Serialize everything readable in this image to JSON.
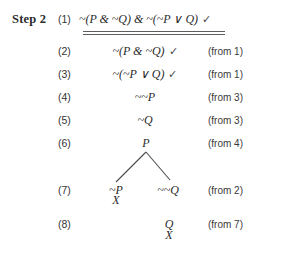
{
  "step": {
    "label": "Step 2"
  },
  "symbols": {
    "negation": "~",
    "conjunction": "&",
    "disjunction": "∨",
    "check": "✓",
    "closure": "X"
  },
  "lines": [
    {
      "number": "(1)",
      "formula": "~(P & ~Q) & ~(~P ∨ Q)",
      "check": "✓",
      "justification": ""
    },
    {
      "number": "(2)",
      "formula": "~(P & ~Q)",
      "check": "✓",
      "justification": "(from 1)"
    },
    {
      "number": "(3)",
      "formula": "~(~P ∨ Q)",
      "check": "✓",
      "justification": "(from 1)"
    },
    {
      "number": "(4)",
      "formula": "~~P",
      "check": "",
      "justification": "(from 3)"
    },
    {
      "number": "(5)",
      "formula": "~Q",
      "check": "",
      "justification": "(from 3)"
    },
    {
      "number": "(6)",
      "formula": "P",
      "check": "",
      "justification": "(from 4)"
    },
    {
      "number": "(7)",
      "formula_left": "~P",
      "formula_right": "~~Q",
      "check": "",
      "justification": "(from 2)"
    },
    {
      "number": "(8)",
      "formula": "Q",
      "check": "",
      "justification": "(from 7)"
    }
  ],
  "closures": {
    "line7_left": "X",
    "line8_right": "X"
  }
}
